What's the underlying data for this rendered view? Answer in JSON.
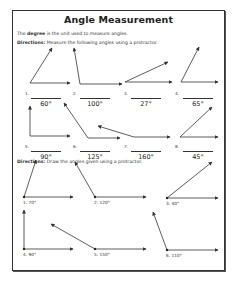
{
  "worksheet": {
    "title": "Angle Measurement",
    "intro": {
      "prefix": "The ",
      "bold": "degree",
      "suffix": " is the unit used to measure angles."
    },
    "section1": {
      "directions_label": "Directions:",
      "directions_text": " Measure the following angles using a protractor.",
      "items": [
        {
          "number": "1.",
          "answer": "60°"
        },
        {
          "number": "2.",
          "answer": "100°"
        },
        {
          "number": "3.",
          "answer": "27°"
        },
        {
          "number": "4.",
          "answer": "65°"
        },
        {
          "number": "5.",
          "answer": "90°"
        },
        {
          "number": "6.",
          "answer": "125°"
        },
        {
          "number": "7.",
          "answer": "160°"
        },
        {
          "number": "8.",
          "answer": "45°"
        }
      ]
    },
    "section2": {
      "directions_label": "Directions:",
      "directions_text": " Draw the angles given using a protractor.",
      "items": [
        {
          "label": "1. 70°"
        },
        {
          "label": "2. 120°"
        },
        {
          "label": "3. 40°"
        },
        {
          "label": "4. 90°"
        },
        {
          "label": "5. 150°"
        },
        {
          "label": "6. 110°"
        }
      ]
    }
  },
  "colors": {
    "ink": "#333333",
    "paper": "#ffffff"
  }
}
